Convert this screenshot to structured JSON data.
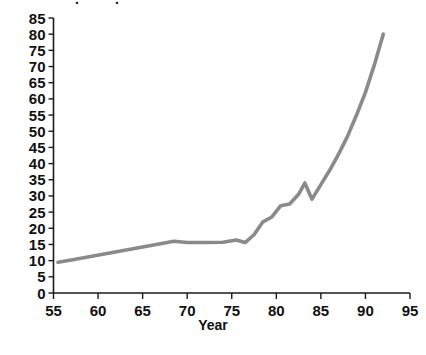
{
  "chart_data": {
    "type": "line",
    "title": "",
    "xlabel": "Year",
    "ylabel": "",
    "xlim": [
      55,
      95
    ],
    "ylim": [
      0,
      85
    ],
    "grid": false,
    "legend": false,
    "line_color": "#8a8a8a",
    "axis_color": "#1a1a1a",
    "x_ticks": [
      55,
      60,
      65,
      70,
      75,
      80,
      85,
      90,
      95
    ],
    "x_tick_labels": [
      "55",
      "60",
      "65",
      "70",
      "75",
      "80",
      "85",
      "90",
      "95"
    ],
    "y_ticks": [
      0,
      5,
      10,
      15,
      20,
      25,
      30,
      35,
      40,
      45,
      50,
      55,
      60,
      65,
      70,
      75,
      80,
      85
    ],
    "y_tick_labels": [
      "0",
      "5",
      "10",
      "15",
      "20",
      "25",
      "30",
      "35",
      "40",
      "45",
      "50",
      "55",
      "60",
      "65",
      "70",
      "75",
      "80",
      "85"
    ],
    "series": [
      {
        "name": "value",
        "x": [
          55.5,
          57,
          59,
          61,
          63,
          65,
          67,
          68.5,
          70,
          72,
          74,
          75.5,
          76.5,
          77.5,
          78.5,
          79.5,
          80.5,
          81.5,
          82.5,
          83.2,
          84,
          85,
          86,
          87,
          88,
          89,
          90,
          91,
          92
        ],
        "values": [
          9.5,
          10.2,
          11.2,
          12.2,
          13.2,
          14.2,
          15.2,
          16.0,
          15.6,
          15.6,
          15.7,
          16.4,
          15.6,
          18.0,
          22.0,
          23.5,
          27.0,
          27.5,
          30.5,
          34.0,
          29.0,
          33.5,
          38.0,
          43.0,
          48.5,
          55.0,
          62.0,
          70.5,
          80.0
        ]
      }
    ]
  },
  "top_cropped_text": {
    "fragment": "."
  },
  "axis_titles": {
    "x": "Year"
  }
}
